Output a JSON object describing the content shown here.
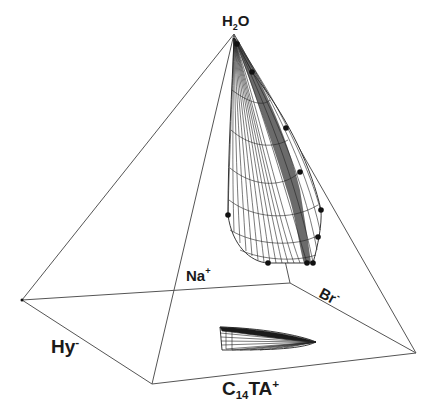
{
  "figure": {
    "type": "quaternary-phase-diagram-pyramid",
    "vertices": {
      "apex": {
        "name": "H2O",
        "main": "H",
        "sub": "2",
        "tail": "O",
        "x": 234,
        "y": 34
      },
      "back": {
        "name": "Na+",
        "main": "Na",
        "sup": "+",
        "x": 290,
        "y": 283
      },
      "right": {
        "name": "Br-",
        "main": "Br",
        "sup": "-",
        "x": 416,
        "y": 353
      },
      "left": {
        "name": "Hy-",
        "main": "Hy",
        "sup": "-",
        "x": 22,
        "y": 300
      },
      "front": {
        "name": "C14TA+",
        "main": "C",
        "sub": "14",
        "tail": "TA",
        "sup": "+",
        "x": 152,
        "y": 384
      }
    },
    "labels": {
      "h2o": {
        "main": "H",
        "sub": "2",
        "tail": "O"
      },
      "na": {
        "main": "Na",
        "sup": "+"
      },
      "br": {
        "main": "Br",
        "sup": "-"
      },
      "hy": {
        "main": "Hy",
        "sup": "-"
      },
      "c14ta": {
        "main": "C",
        "sub": "14",
        "tail": "TA",
        "sup": "+"
      }
    },
    "surface_points": [
      [
        237,
        44
      ],
      [
        252,
        72
      ],
      [
        286,
        128
      ],
      [
        300,
        172
      ],
      [
        321,
        210
      ],
      [
        318,
        237
      ],
      [
        228,
        215
      ],
      [
        268,
        263
      ],
      [
        307,
        263
      ],
      [
        313,
        263
      ]
    ],
    "colors": {
      "line": "#555555",
      "mesh": "#222222",
      "point": "#111111",
      "background": "#ffffff"
    }
  }
}
